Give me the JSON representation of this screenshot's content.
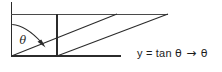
{
  "figure": {
    "background_color": "#ffffff",
    "stroke_color": "#2b2b2b",
    "annotation": {
      "y_label": "y",
      "equals": "=",
      "tan_label": "tan",
      "theta_symbol": "θ",
      "arrow_symbol": "→",
      "limit_symbol": "θ",
      "full_text": "y = tan θ  →  θ"
    },
    "angle_label": "θ",
    "geometry": {
      "vertical_axis": {
        "x": 11.5,
        "y_top": 2,
        "y_bottom": 56
      },
      "baseline": {
        "y": 56,
        "x_start": 11.5,
        "x_end": 121
      },
      "top_line": {
        "y": 14,
        "x_start": 11.5,
        "x_end": 168
      },
      "inner_vertical": {
        "x": 57,
        "y_top": 14,
        "y_bottom": 56
      },
      "diagonal_one": {
        "x1": 11.5,
        "y1": 56,
        "x2": 117,
        "y2": 14
      },
      "diagonal_two": {
        "x1": 57,
        "y1": 56,
        "x2": 168,
        "y2": 14
      },
      "angle_arc": {
        "cx": 11.5,
        "cy": 56,
        "start_x": 12,
        "start_y": 24,
        "end_x": 42,
        "end_y": 43
      },
      "arrowhead": {
        "x": 44,
        "y": 45,
        "direction": "down-right"
      },
      "theta_position": {
        "x": 22,
        "y": 41
      }
    }
  }
}
